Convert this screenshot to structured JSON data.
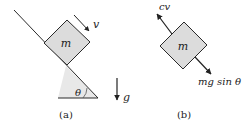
{
  "panel_a": {
    "caption": "(a)",
    "mass_label": "m",
    "velocity_label": "v",
    "angle_label": "θ",
    "gravity_label": "g"
  },
  "panel_b": {
    "caption": "(b)",
    "mass_label": "m",
    "drag_force_label": "cv",
    "gravity_component_label": "mg sin θ"
  },
  "colors": {
    "block_fill": "#dcdcdc",
    "incline_shade": "#e6e6e6",
    "line": "#2a2a2a"
  }
}
